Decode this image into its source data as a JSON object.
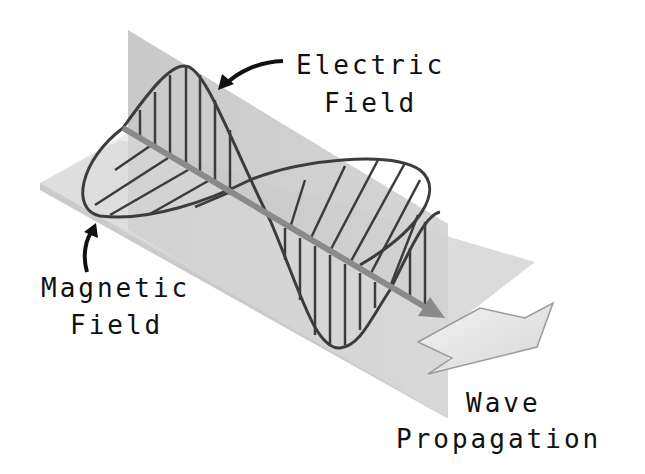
{
  "figure": {
    "type": "electromagnetic-wave-diagram",
    "labels": {
      "electric_line1": "Electric",
      "electric_line2": "Field",
      "magnetic_line1": "Magnetic",
      "magnetic_line2": "Field",
      "propagation_line1": "Wave",
      "propagation_line2": "Propagation"
    },
    "colors": {
      "vertical_plane": "#c8c8c8",
      "horizontal_plane": "#dedede",
      "wave_line": "#3c3c3c",
      "axis_arrow": "#8a8a8a",
      "text": "#111111",
      "background": "#ffffff"
    }
  }
}
